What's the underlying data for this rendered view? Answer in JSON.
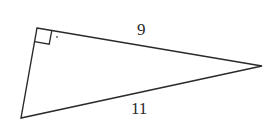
{
  "diagram": {
    "type": "right-triangle",
    "stroke_color": "#2a2a2a",
    "vertices": {
      "right_angle": [
        37,
        28
      ],
      "apex": [
        262,
        66
      ],
      "bottom": [
        21,
        118
      ]
    },
    "right_angle_marker": true,
    "sides": {
      "leg_top": {
        "label": "9"
      },
      "hypotenuse": {
        "label": "11"
      },
      "leg_left": {
        "label": ""
      }
    }
  }
}
